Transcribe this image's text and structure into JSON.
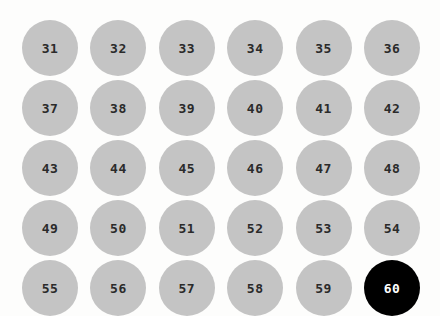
{
  "page": {
    "background_color": "#fdfdfc"
  },
  "grid": {
    "columns": 6,
    "rows": 5,
    "badge_color": "#c4c4c4",
    "badge_text_color": "#2b2b2b",
    "selected_color": "#000000",
    "selected_text_color": "#ffffff",
    "selected_value": "60",
    "items": [
      {
        "label": "31",
        "selected": false
      },
      {
        "label": "32",
        "selected": false
      },
      {
        "label": "33",
        "selected": false
      },
      {
        "label": "34",
        "selected": false
      },
      {
        "label": "35",
        "selected": false
      },
      {
        "label": "36",
        "selected": false
      },
      {
        "label": "37",
        "selected": false
      },
      {
        "label": "38",
        "selected": false
      },
      {
        "label": "39",
        "selected": false
      },
      {
        "label": "40",
        "selected": false
      },
      {
        "label": "41",
        "selected": false
      },
      {
        "label": "42",
        "selected": false
      },
      {
        "label": "43",
        "selected": false
      },
      {
        "label": "44",
        "selected": false
      },
      {
        "label": "45",
        "selected": false
      },
      {
        "label": "46",
        "selected": false
      },
      {
        "label": "47",
        "selected": false
      },
      {
        "label": "48",
        "selected": false
      },
      {
        "label": "49",
        "selected": false
      },
      {
        "label": "50",
        "selected": false
      },
      {
        "label": "51",
        "selected": false
      },
      {
        "label": "52",
        "selected": false
      },
      {
        "label": "53",
        "selected": false
      },
      {
        "label": "54",
        "selected": false
      },
      {
        "label": "55",
        "selected": false
      },
      {
        "label": "56",
        "selected": false
      },
      {
        "label": "57",
        "selected": false
      },
      {
        "label": "58",
        "selected": false
      },
      {
        "label": "59",
        "selected": false
      },
      {
        "label": "60",
        "selected": true
      }
    ]
  }
}
